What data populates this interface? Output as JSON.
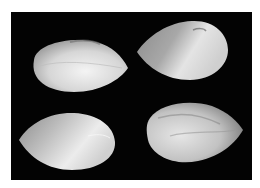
{
  "image": {
    "subject": "Four seeds on a black background",
    "background_color": "#030303",
    "border_color": "#ffffff",
    "seeds": [
      {
        "id": "top-left",
        "tip": "right"
      },
      {
        "id": "top-right",
        "tip": "left"
      },
      {
        "id": "bottom-left",
        "tip": "left"
      },
      {
        "id": "bottom-right",
        "tip": "right"
      }
    ]
  }
}
